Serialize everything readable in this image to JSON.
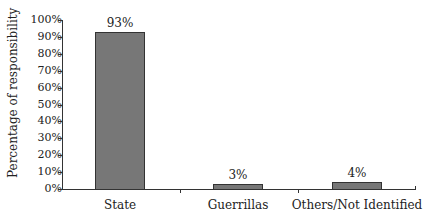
{
  "chart_data": {
    "type": "bar",
    "title": "",
    "xlabel": "",
    "ylabel": "Percentage of responsibility",
    "categories": [
      "State",
      "Guerrillas",
      "Others/Not Identified"
    ],
    "values": [
      93,
      3,
      4
    ],
    "data_labels": [
      "93%",
      "3%",
      "4%"
    ],
    "ylim": [
      0,
      100
    ],
    "yticks": [
      "0%",
      "10%",
      "20%",
      "30%",
      "40%",
      "50%",
      "60%",
      "70%",
      "80%",
      "90%",
      "100%"
    ],
    "grid": false,
    "legend": null,
    "bar_color": "#777777"
  }
}
